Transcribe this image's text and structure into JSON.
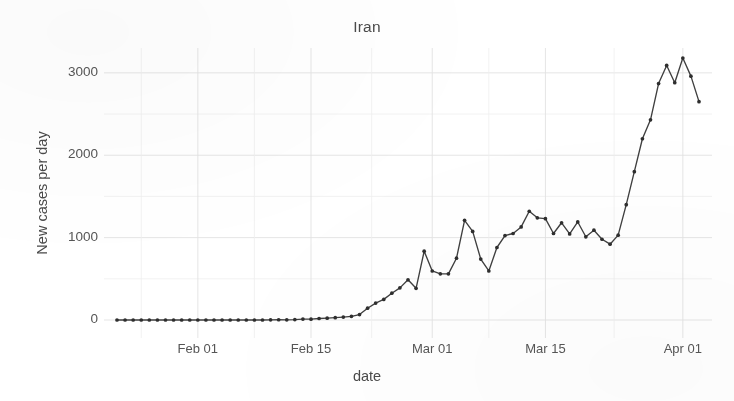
{
  "chart_data": {
    "type": "line",
    "title": "Iran",
    "xlabel": "date",
    "ylabel": "New cases per day",
    "legend": null,
    "grid": true,
    "grid_major_color": "#e2e2e2",
    "grid_minor_color": "#efefef",
    "panel_background": "#ffffff",
    "line_color": "#3f3f3f",
    "point_color": "#2e2e2e",
    "marker": "circle",
    "xlim": [
      "2020-01-22",
      "2020-04-03"
    ],
    "ylim": [
      0,
      3180
    ],
    "ytick_labels": [
      "0",
      "1000",
      "2000",
      "3000"
    ],
    "ytick_values": [
      0,
      1000,
      2000,
      3000
    ],
    "ytick_minor_values": [
      500,
      1500,
      2500
    ],
    "xtick_labels": [
      "Feb 01",
      "Feb 15",
      "Mar 01",
      "Mar 15",
      "Apr 01"
    ],
    "xtick_dates": [
      "2020-02-01",
      "2020-02-15",
      "2020-03-01",
      "2020-03-15",
      "2020-04-01"
    ],
    "x": [
      "2020-01-22",
      "2020-01-23",
      "2020-01-24",
      "2020-01-25",
      "2020-01-26",
      "2020-01-27",
      "2020-01-28",
      "2020-01-29",
      "2020-01-30",
      "2020-01-31",
      "2020-02-01",
      "2020-02-02",
      "2020-02-03",
      "2020-02-04",
      "2020-02-05",
      "2020-02-06",
      "2020-02-07",
      "2020-02-08",
      "2020-02-09",
      "2020-02-10",
      "2020-02-11",
      "2020-02-12",
      "2020-02-13",
      "2020-02-14",
      "2020-02-15",
      "2020-02-16",
      "2020-02-17",
      "2020-02-18",
      "2020-02-19",
      "2020-02-20",
      "2020-02-21",
      "2020-02-22",
      "2020-02-23",
      "2020-02-24",
      "2020-02-25",
      "2020-02-26",
      "2020-02-27",
      "2020-02-28",
      "2020-02-29",
      "2020-03-01",
      "2020-03-02",
      "2020-03-03",
      "2020-03-04",
      "2020-03-05",
      "2020-03-06",
      "2020-03-07",
      "2020-03-08",
      "2020-03-09",
      "2020-03-10",
      "2020-03-11",
      "2020-03-12",
      "2020-03-13",
      "2020-03-14",
      "2020-03-15",
      "2020-03-16",
      "2020-03-17",
      "2020-03-18",
      "2020-03-19",
      "2020-03-20",
      "2020-03-21",
      "2020-03-22",
      "2020-03-23",
      "2020-03-24",
      "2020-03-25",
      "2020-03-26",
      "2020-03-27",
      "2020-03-28",
      "2020-03-29",
      "2020-03-30",
      "2020-03-31",
      "2020-04-01",
      "2020-04-02",
      "2020-04-03"
    ],
    "values": [
      0,
      0,
      0,
      0,
      0,
      0,
      0,
      0,
      0,
      0,
      0,
      0,
      0,
      0,
      0,
      0,
      0,
      0,
      0,
      2,
      3,
      2,
      5,
      11,
      10,
      18,
      22,
      28,
      35,
      44,
      66,
      143,
      205,
      250,
      325,
      390,
      488,
      385,
      835,
      595,
      560,
      560,
      750,
      1210,
      1075,
      740,
      595,
      880,
      1025,
      1050,
      1130,
      1320,
      1240,
      1230,
      1050,
      1180,
      1045,
      1190,
      1010,
      1090,
      980,
      920,
      1030,
      1400,
      1800,
      2200,
      2430,
      2870,
      3090,
      2880,
      3180,
      2960,
      2650
    ],
    "series_name": "New cases per day"
  },
  "meta": {
    "title_text": "Iran",
    "ylabel_text": "New cases per day",
    "xlabel_text": "date"
  }
}
